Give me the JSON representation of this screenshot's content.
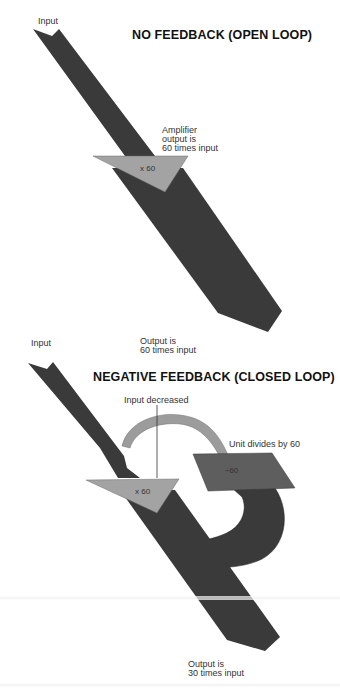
{
  "colors": {
    "signal_band": "#3a3a3a",
    "amplifier": "#a3a3a3",
    "feedback_arc": "#9c9c9c",
    "divider_unit": "#5e5e5e",
    "background": "#ffffff",
    "text": "#333333"
  },
  "open_loop": {
    "title": "NO FEEDBACK (OPEN LOOP)",
    "input_label": "Input",
    "amplifier_note_line1": "Amplifier",
    "amplifier_note_line2": "output is",
    "amplifier_note_line3": "60 times input",
    "amplifier_symbol": "x 60",
    "output_line1": "Output is",
    "output_line2": "60 times input"
  },
  "closed_loop": {
    "title": "NEGATIVE FEEDBACK (CLOSED LOOP)",
    "input_label": "Input",
    "input_decreased_label": "Input decreased",
    "divider_label": "Unit divides by 60",
    "divider_symbol": "÷60",
    "amplifier_symbol": "x 60",
    "output_line1": "Output is",
    "output_line2": "30 times input"
  }
}
